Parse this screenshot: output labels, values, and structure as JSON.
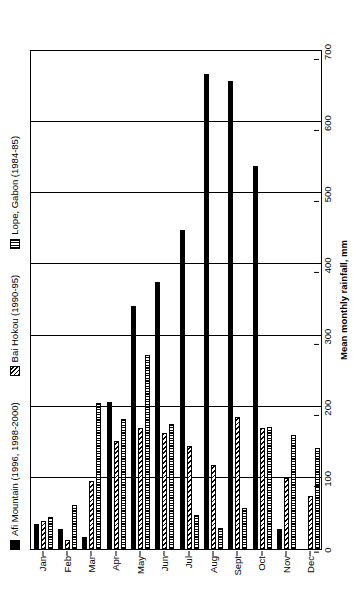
{
  "chart_data": {
    "type": "bar",
    "title": "",
    "xlabel": "",
    "ylabel": "Mean monthly rainfall, mm",
    "orientation": "horizontal-rotated",
    "grid": true,
    "legend_position": "top",
    "axis_range": [
      0,
      700
    ],
    "axis_ticks": [
      0,
      100,
      200,
      300,
      400,
      500,
      600,
      700
    ],
    "categories": [
      "Jan",
      "Feb",
      "Mar",
      "Apr",
      "May",
      "Jun",
      "Jul",
      "Aug",
      "Sept",
      "Oct",
      "Nov",
      "Dec"
    ],
    "series": [
      {
        "name": "Afi Mountain (1996, 1998-2000)",
        "pattern": "solid-black",
        "color": "#000000",
        "values": [
          35,
          28,
          17,
          207,
          341,
          375,
          449,
          668,
          658,
          539,
          28,
          0
        ]
      },
      {
        "name": "Bai Hokou (1990-95)",
        "pattern": "diagonal-hatch",
        "color": "#000000",
        "values": [
          40,
          13,
          95,
          152,
          170,
          163,
          145,
          118,
          185,
          170,
          100,
          75
        ]
      },
      {
        "name": "Lope, Gabon (1984-85)",
        "pattern": "vertical-hatch",
        "color": "#000000",
        "values": [
          45,
          62,
          205,
          183,
          272,
          175,
          48,
          30,
          58,
          172,
          160,
          142
        ]
      }
    ]
  },
  "legend": {
    "items": [
      {
        "label": "Afi Mountain (1996, 1998-2000)",
        "swatch": "solid-square-icon"
      },
      {
        "label": "Bai Hokou (1990-95)",
        "swatch": "diagonal-hatch-square-icon"
      },
      {
        "label": "Lope, Gabon (1984-85)",
        "swatch": "vertical-hatch-square-icon"
      }
    ]
  },
  "axis": {
    "y_title": "Mean monthly rainfall, mm",
    "y_ticks": [
      "0",
      "100",
      "200",
      "300",
      "400",
      "500",
      "600",
      "700"
    ],
    "x_ticks": [
      "Jan",
      "Feb",
      "Mar",
      "Apr",
      "May",
      "Jun",
      "Jul",
      "Aug",
      "Sept",
      "Oct",
      "Nov",
      "Dec"
    ]
  }
}
